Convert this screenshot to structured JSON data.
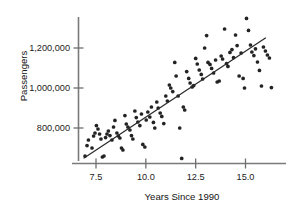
{
  "chart_data": {
    "type": "scatter",
    "title": "",
    "xlabel": "Years Since 1990",
    "ylabel": "Passengers",
    "xlim": [
      6.85,
      16.5
    ],
    "ylim": [
      630000,
      1375000
    ],
    "grid": false,
    "legend": null,
    "xticks": [
      7.5,
      10.0,
      12.5,
      15.0
    ],
    "xtick_labels": [
      "7.5",
      "10.0",
      "12.5",
      "15.0"
    ],
    "yticks": [
      800000,
      1000000,
      1200000
    ],
    "ytick_labels": [
      "800,000",
      "1,000,000",
      "1,200,000"
    ],
    "series": [
      {
        "name": "Passengers",
        "marker": "filled-circle",
        "color": "#232323",
        "x": [
          6.95,
          7.05,
          7.12,
          7.3,
          7.38,
          7.45,
          7.52,
          7.6,
          7.68,
          7.75,
          7.82,
          7.9,
          7.98,
          8.05,
          8.12,
          8.2,
          8.3,
          8.38,
          8.45,
          8.55,
          8.62,
          8.7,
          8.78,
          8.85,
          8.95,
          9.02,
          9.1,
          9.2,
          9.28,
          9.35,
          9.45,
          9.52,
          9.6,
          9.7,
          9.78,
          9.85,
          9.95,
          10.02,
          10.1,
          10.2,
          10.28,
          10.38,
          10.45,
          10.55,
          10.62,
          10.72,
          10.8,
          10.9,
          11.0,
          11.08,
          11.18,
          11.25,
          11.35,
          11.45,
          11.52,
          11.62,
          11.7,
          11.8,
          11.88,
          11.95,
          12.05,
          12.15,
          12.22,
          12.32,
          12.4,
          12.5,
          12.58,
          12.68,
          12.78,
          12.85,
          12.95,
          13.05,
          13.12,
          13.22,
          13.3,
          13.4,
          13.5,
          13.58,
          13.68,
          13.78,
          13.85,
          13.95,
          14.05,
          14.12,
          14.22,
          14.32,
          14.4,
          14.5,
          14.58,
          14.68,
          14.78,
          14.88,
          14.95,
          15.05,
          15.15,
          15.25,
          15.32,
          15.42,
          15.5,
          15.6,
          15.7,
          15.8,
          15.9,
          16.0,
          16.1,
          16.2,
          16.3
        ],
        "y": [
          660000,
          712000,
          740000,
          700000,
          760000,
          775000,
          812000,
          795000,
          770000,
          745000,
          655000,
          660000,
          752000,
          770000,
          785000,
          762000,
          740000,
          805000,
          838000,
          775000,
          760000,
          750000,
          700000,
          690000,
          862000,
          820000,
          805000,
          790000,
          762000,
          745000,
          885000,
          852000,
          830000,
          812000,
          870000,
          718000,
          705000,
          840000,
          880000,
          855000,
          905000,
          828000,
          800000,
          930000,
          900000,
          875000,
          858000,
          822000,
          960000,
          935000,
          1015000,
          1000000,
          982000,
          1128000,
          1060000,
          960000,
          800000,
          648000,
          905000,
          890000,
          1082000,
          1048000,
          1025000,
          1005000,
          1012000,
          1148000,
          1120000,
          1090000,
          1068000,
          1045000,
          1200000,
          1262000,
          1128000,
          1118000,
          1098000,
          1075000,
          1140000,
          1030000,
          1035000,
          1160000,
          1145000,
          1295000,
          1122000,
          1108000,
          1178000,
          1192000,
          1152000,
          1265000,
          1212000,
          1060000,
          1175000,
          1048000,
          1000000,
          1348000,
          1288000,
          1215000,
          1180000,
          1162000,
          1196000,
          1130000,
          1088000,
          1010000,
          1205000,
          1185000,
          1165000,
          1150000,
          1002000
        ]
      }
    ],
    "fit_line": {
      "name": "least-squares-regression-line",
      "x_start": 6.9,
      "y_start": 650000,
      "x_end": 16.0,
      "y_end": 1250000
    }
  },
  "axis_titles": {
    "x": "Years Since 1990",
    "y": "Passengers"
  }
}
